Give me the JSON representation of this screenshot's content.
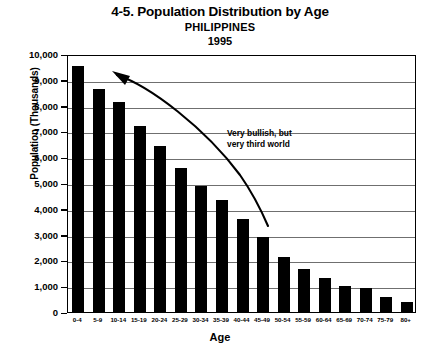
{
  "title": {
    "main": "4-5. Population Distribution by Age",
    "country": "PHILIPPINES",
    "year": "1995"
  },
  "annotation": {
    "text": "Very bullish, but\nvery third world",
    "arrow": "curved-arrow-pointing-up-left"
  },
  "axes": {
    "y_title": "Population (Thousands)",
    "x_title": "Age"
  },
  "colors": {
    "bar": "#000000",
    "grid": "#6f6f6f",
    "axis": "#000000",
    "background": "#ffffff"
  },
  "chart_data": {
    "type": "bar",
    "title": "4-5. Population Distribution by Age",
    "subtitle": "PHILIPPINES 1995",
    "xlabel": "Age",
    "ylabel": "Population (Thousands)",
    "ylim": [
      0,
      10000
    ],
    "yticks": [
      0,
      1000,
      2000,
      3000,
      4000,
      5000,
      6000,
      7000,
      8000,
      9000,
      10000
    ],
    "ytick_labels": [
      "0",
      "1,000",
      "2,000",
      "3,000",
      "4,000",
      "5,000",
      "6,000",
      "7,000",
      "8,000",
      "9,000",
      "10,000"
    ],
    "grid": true,
    "legend": false,
    "categories": [
      "0-4",
      "5-9",
      "10-14",
      "15-19",
      "20-24",
      "25-29",
      "30-34",
      "35-39",
      "40-44",
      "45-49",
      "50-54",
      "55-59",
      "60-64",
      "65-69",
      "70-74",
      "75-79",
      "80+"
    ],
    "values": [
      9550,
      8650,
      8150,
      7200,
      6450,
      5600,
      4900,
      4350,
      3600,
      2900,
      2150,
      1650,
      1300,
      1000,
      950,
      600,
      400
    ],
    "annotations": [
      "Very bullish, but very third world"
    ]
  }
}
